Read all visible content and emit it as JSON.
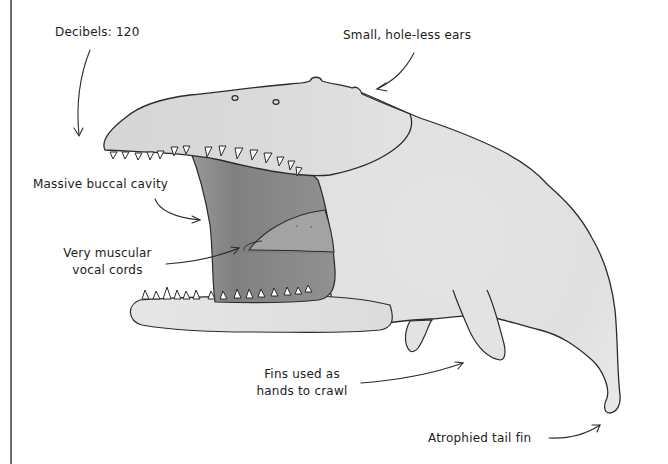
{
  "illustration": {
    "subject": "whale-like creature with open mouth",
    "colors": {
      "background": "#ffffff",
      "body_fill": "#e2e2e2",
      "body_shadow": "#d2d2d2",
      "mouth_fill": "#8f8f8f",
      "mouth_dark": "#7c7c7c",
      "vocal_cord_fill": "#a2a2a2",
      "outline": "#2b2b2b",
      "teeth": "#ffffff",
      "frame_line": "#6e6e6e"
    }
  },
  "labels": {
    "decibels": "Decibels: 120",
    "ears": "Small, hole-less ears",
    "buccal_cavity": "Massive buccal cavity",
    "vocal_cords_line1": "Very muscular",
    "vocal_cords_line2": "vocal cords",
    "fins_line1": "Fins used as",
    "fins_line2": "hands to crawl",
    "tail_fin": "Atrophied tail fin"
  }
}
